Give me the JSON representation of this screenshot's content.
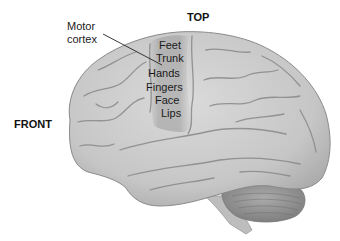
{
  "diagram": {
    "orientation_labels": {
      "top": "TOP",
      "front": "FRONT"
    },
    "callout": {
      "line1": "Motor",
      "line2": "cortex"
    },
    "motor_map": [
      {
        "label": "Feet"
      },
      {
        "label": "Trunk"
      },
      {
        "label": "Hands"
      },
      {
        "label": "Fingers"
      },
      {
        "label": "Face"
      },
      {
        "label": "Lips"
      }
    ],
    "colors": {
      "brain_fill": "#c4c4c4",
      "brain_light": "#d8d8d8",
      "sulcus": "#8e8e8e",
      "motor_strip": "#a9a9a9",
      "cerebellum": "#9a9a9a",
      "text": "#111111"
    }
  }
}
